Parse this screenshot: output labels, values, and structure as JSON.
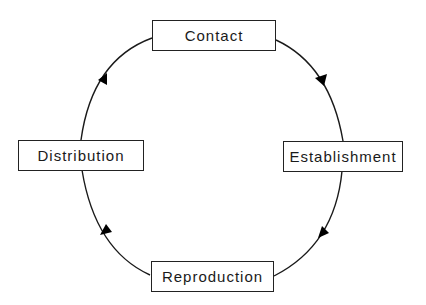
{
  "diagram": {
    "type": "cycle",
    "nodes": [
      {
        "id": "contact",
        "label": "Contact"
      },
      {
        "id": "establishment",
        "label": "Establishment"
      },
      {
        "id": "reproduction",
        "label": "Reproduction"
      },
      {
        "id": "distribution",
        "label": "Distribution"
      }
    ],
    "edges": [
      {
        "from": "contact",
        "to": "establishment"
      },
      {
        "from": "establishment",
        "to": "reproduction"
      },
      {
        "from": "reproduction",
        "to": "distribution"
      },
      {
        "from": "distribution",
        "to": "contact"
      }
    ],
    "colors": {
      "stroke": "#1a1a1a",
      "background": "#ffffff"
    }
  }
}
